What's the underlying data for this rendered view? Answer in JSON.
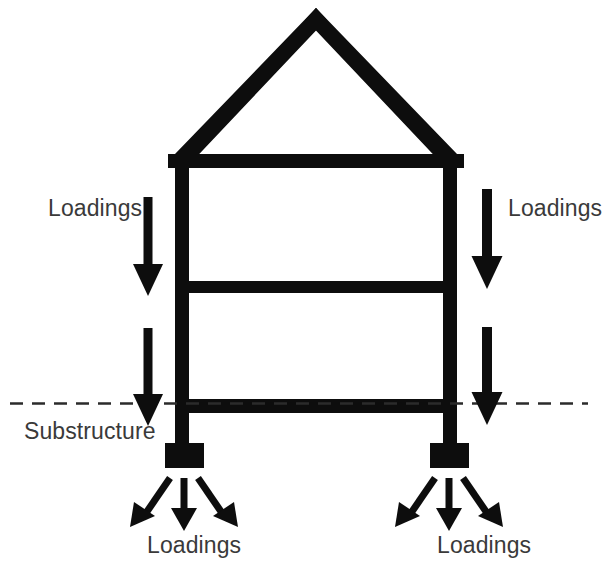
{
  "figure": {
    "kind": "structural-load-path-diagram",
    "background_color": "#ffffff",
    "ink_color": "#0d0d0d",
    "text_color": "#3a3a3a",
    "ground_line_color": "#2b2b2b",
    "width": 603,
    "height": 578
  },
  "labels": {
    "loadings_upper_left": "Loadings",
    "loadings_upper_right": "Loadings",
    "substructure": "Substructure",
    "loadings_footing_left": "Loadings",
    "loadings_footing_right": "Loadings"
  },
  "structure": {
    "roof": {
      "apex_x": 316,
      "apex_y": 8,
      "left_eave_x": 172,
      "right_eave_x": 460,
      "eave_y": 160,
      "thickness": 14
    },
    "columns": [
      {
        "name": "left-column",
        "x": 175,
        "top": 154,
        "bottom": 448,
        "width": 14
      },
      {
        "name": "right-column",
        "x": 443,
        "top": 154,
        "bottom": 448,
        "width": 14
      }
    ],
    "beams": [
      {
        "name": "top-beam",
        "x": 168,
        "y": 154,
        "width": 296,
        "height": 14
      },
      {
        "name": "middle-beam",
        "x": 175,
        "y": 281,
        "width": 282,
        "height": 12
      },
      {
        "name": "bottom-beam",
        "x": 175,
        "y": 399,
        "width": 282,
        "height": 14
      }
    ],
    "footings": [
      {
        "name": "left-footing",
        "x": 165,
        "y": 443,
        "width": 39,
        "height": 25
      },
      {
        "name": "right-footing",
        "x": 430,
        "y": 443,
        "width": 39,
        "height": 25
      }
    ],
    "ground_line": {
      "y": 403,
      "x_start": 10,
      "x_end": 588,
      "dash": 13,
      "gap": 9,
      "thickness": 2.5
    }
  },
  "arrows": {
    "superstructure_loads": [
      {
        "name": "load-arrow-upper-left",
        "x": 148,
        "y_start": 197,
        "y_tip": 296,
        "shaft_width": 9,
        "head_width": 30,
        "head_length": 32
      },
      {
        "name": "load-arrow-lower-left",
        "x": 148,
        "y_start": 328,
        "y_tip": 426,
        "shaft_width": 9,
        "head_width": 30,
        "head_length": 32
      },
      {
        "name": "load-arrow-upper-right",
        "x": 487,
        "y_start": 189,
        "y_tip": 289,
        "shaft_width": 10,
        "head_width": 31,
        "head_length": 33
      },
      {
        "name": "load-arrow-lower-right",
        "x": 487,
        "y_start": 327,
        "y_tip": 425,
        "shaft_width": 10,
        "head_width": 31,
        "head_length": 33
      }
    ],
    "footing_loads_left": [
      {
        "name": "footing-arrow-left-outer",
        "x1": 168,
        "y1": 477,
        "x2": 137,
        "y2": 523
      },
      {
        "name": "footing-arrow-left-middle",
        "x1": 184,
        "y1": 477,
        "x2": 184,
        "y2": 527
      },
      {
        "name": "footing-arrow-left-inner",
        "x1": 200,
        "y1": 477,
        "x2": 230,
        "y2": 523
      }
    ],
    "footing_loads_right": [
      {
        "name": "footing-arrow-right-outer",
        "x1": 433,
        "y1": 477,
        "x2": 402,
        "y2": 523
      },
      {
        "name": "footing-arrow-right-middle",
        "x1": 449,
        "y1": 477,
        "x2": 449,
        "y2": 527
      },
      {
        "name": "footing-arrow-right-inner",
        "x1": 465,
        "y1": 477,
        "x2": 495,
        "y2": 523
      }
    ]
  }
}
